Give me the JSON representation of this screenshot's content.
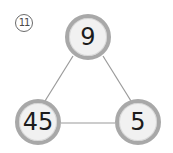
{
  "problem": {
    "number_label": "11",
    "number_glyph": "⑪"
  },
  "diagram": {
    "type": "triangle-number-graph",
    "colors": {
      "node_ring": "#a8a8a8",
      "node_fill": "#f1f1f1",
      "edge": "#9a9a9a",
      "text": "#1c1c1c"
    },
    "nodes": [
      {
        "id": "top",
        "value": "9"
      },
      {
        "id": "bottom-left",
        "value": "45"
      },
      {
        "id": "bottom-right",
        "value": "5"
      }
    ],
    "edges": [
      {
        "from": "top",
        "to": "bottom-left"
      },
      {
        "from": "top",
        "to": "bottom-right"
      },
      {
        "from": "bottom-left",
        "to": "bottom-right"
      }
    ]
  }
}
